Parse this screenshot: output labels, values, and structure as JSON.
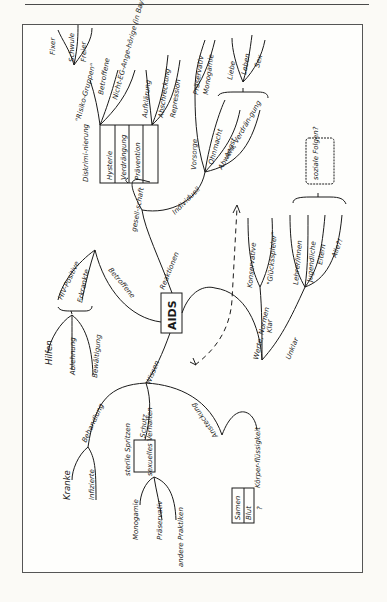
{
  "page": {
    "background": "#fbfaf6",
    "ink": "#1a1a1a"
  },
  "mindmap": {
    "center": "AIDS",
    "branches": {
      "reaktionen": {
        "label": "Reaktionen",
        "gesellschaft": {
          "label": "gesell-schaft",
          "columns": [
            "Diskrimi-nierung",
            "Hysterie",
            "Verdrängung",
            "Prävention"
          ],
          "risikogruppen": {
            "label": "\"Risiko-Gruppen\"",
            "items": [
              "Fixer",
              "Schwule",
              "Freier"
            ]
          },
          "betroffene": {
            "label": "Betroffene",
            "items": [
              "Nicht-EG-Ange-hörige (in Bayern)"
            ]
          },
          "praevention_items": [
            "Aufklärung",
            "Abschreckung",
            "Repression"
          ]
        },
        "individuell": {
          "label": "Individuell",
          "vorsorge": {
            "label": "Vorsorge",
            "items": [
              "Präservativ",
              "Monogamie"
            ]
          },
          "ohnmacht": "Ohnmacht",
          "angst": "Angst",
          "abwehr": "Abwehr, Verdrän-gung",
          "brace_items": [
            "Liebe",
            "Leben",
            "Sex"
          ]
        }
      },
      "betroffene": {
        "label": "Betroffene",
        "items": [
          "HIV-Positive",
          "Erkrankte"
        ],
        "brace_items": [
          "Hilfen",
          "Ablehnung",
          "Bewältigung"
        ]
      },
      "wissen": {
        "label": "Wissen",
        "behandlung": {
          "label": "Behandlung",
          "items": [
            "Kranke",
            "Infizierte"
          ]
        },
        "schutz": {
          "label": "Schutz",
          "columns": [
            "sterile Spritzen",
            "sexuelles Verhalten"
          ],
          "verhalten_items": [
            "Monogamie",
            "Präservativ",
            "andere Praktiken"
          ]
        },
        "ansteckung": {
          "label": "Ansteckung",
          "koerper": "Körper-flüssigkeit",
          "items": [
            "Samen",
            "Blut",
            "?"
          ]
        }
      },
      "werte": {
        "label": "Werte, Normen",
        "klar": {
          "label": "Klar",
          "items": [
            "Konservative",
            "\"Glücksspieler\""
          ]
        },
        "unklar": {
          "label": "Unklar",
          "items": [
            "Lehrer/innen",
            "Jugendliche",
            "Eltern",
            "Alle?!"
          ]
        },
        "note": "soziale Folgen?"
      }
    }
  }
}
